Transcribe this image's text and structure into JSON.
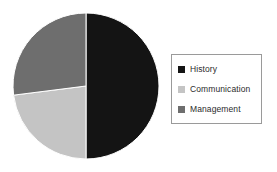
{
  "chart_data": {
    "type": "pie",
    "title": "",
    "subtitle": "",
    "xlabel": "",
    "ylabel": "",
    "grid": false,
    "legend_position": "right",
    "categories": [
      "History",
      "Communication",
      "Management"
    ],
    "values": [
      50,
      23,
      27
    ],
    "units": "percent",
    "colors": [
      "#141414",
      "#c4c4c4",
      "#6e6e6e"
    ],
    "slices": [
      {
        "label": "History",
        "value": 50,
        "color": "#141414",
        "start_angle_deg": 0,
        "end_angle_deg": 180
      },
      {
        "label": "Communication",
        "value": 23,
        "color": "#c4c4c4",
        "start_angle_deg": 180,
        "end_angle_deg": 262.8
      },
      {
        "label": "Management",
        "value": 27,
        "color": "#6e6e6e",
        "start_angle_deg": 262.8,
        "end_angle_deg": 360
      }
    ],
    "geometry": {
      "center_x": 86,
      "center_y": 86,
      "radius": 73
    },
    "annotations": []
  },
  "legend": {
    "border_color": "#9a9a9a",
    "background": "#ffffff",
    "items": [
      {
        "label": "History",
        "color": "#141414"
      },
      {
        "label": "Communication",
        "color": "#c4c4c4"
      },
      {
        "label": "Management",
        "color": "#6e6e6e"
      }
    ]
  }
}
